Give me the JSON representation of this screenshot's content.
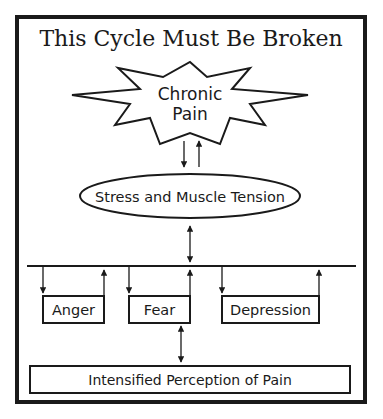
{
  "title": "This Cycle Must Be Broken",
  "nodes": {
    "chronic_pain": {
      "line1": "Chronic",
      "line2": "Pain"
    },
    "stress": "Stress and Muscle Tension",
    "anger": "Anger",
    "fear": "Fear",
    "depression": "Depression",
    "intensified": "Intensified Perception of Pain"
  },
  "colors": {
    "ink": "#1a1a1a",
    "background": "#ffffff"
  }
}
